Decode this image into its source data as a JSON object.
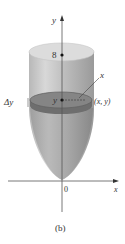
{
  "figure": {
    "caption": "(b)",
    "axes": {
      "y_label": "y",
      "x_label": "x",
      "origin_label": "0"
    },
    "top_level_label": "8",
    "slab": {
      "thickness_label": "Δy",
      "height_label": "y",
      "point_label": "(x, y)",
      "radius_label": "x"
    },
    "colors": {
      "solid_light": "#d4d4d4",
      "solid_mid": "#a8a8a8",
      "solid_dark": "#8a8a8a",
      "slab": "#7a7a7a",
      "axis": "#444444",
      "text": "#333333"
    }
  }
}
